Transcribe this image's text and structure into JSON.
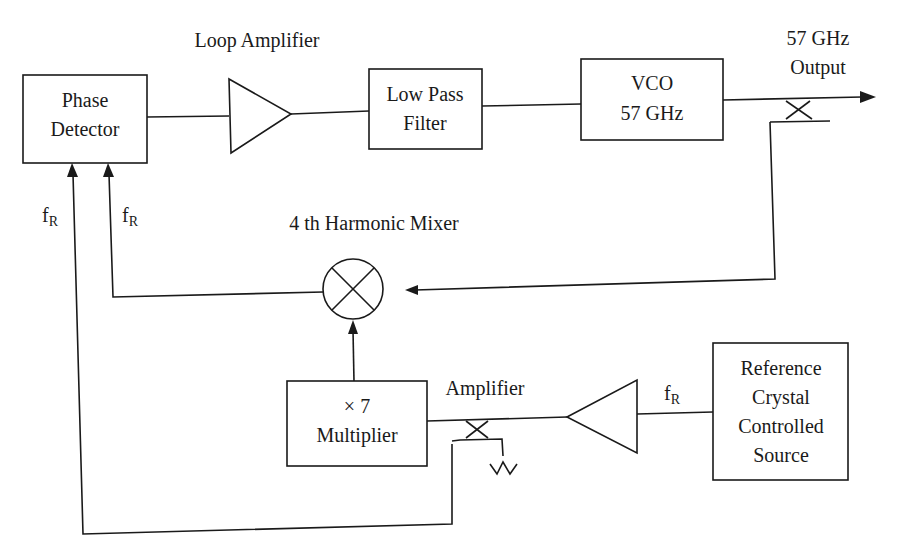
{
  "blocks": {
    "phase_detector": {
      "lines": [
        "Phase",
        "Detector"
      ]
    },
    "low_pass_filter": {
      "lines": [
        "Low Pass",
        "Filter"
      ]
    },
    "vco": {
      "lines": [
        "VCO",
        "57 GHz"
      ]
    },
    "multiplier": {
      "lines": [
        "× 7",
        "Multiplier"
      ]
    },
    "reference": {
      "lines": [
        "Reference",
        "Crystal",
        "Controlled",
        "Source"
      ]
    }
  },
  "labels": {
    "loop_amplifier": "Loop Amplifier",
    "output_line1": "57 GHz",
    "output_line2": "Output",
    "harmonic_mixer": "4 th Harmonic Mixer",
    "amplifier": "Amplifier",
    "fr_main": "f",
    "fr_sub": "R"
  },
  "signals": {
    "reference_frequency": "fR",
    "output_frequency": "57 GHz",
    "multiplication_factor": 7,
    "mixer_harmonic": 4
  },
  "icons": {
    "loop_amplifier": "triangle-amplifier-icon",
    "ref_amplifier": "triangle-amplifier-icon",
    "mixer": "circle-cross-mixer-icon",
    "output_coupler": "directional-coupler-icon",
    "ref_coupler": "directional-coupler-icon",
    "termination": "matched-load-icon"
  }
}
